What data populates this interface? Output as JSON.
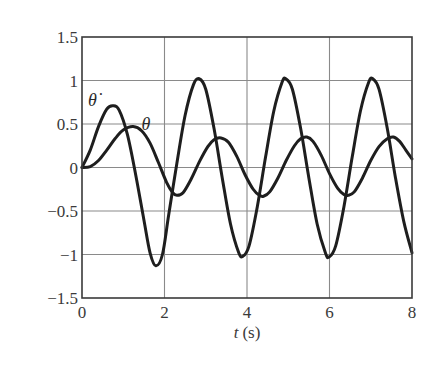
{
  "chart_data": {
    "type": "line",
    "title": "",
    "xlabel": "t (s)",
    "xlabel_italic_part": "t",
    "xlabel_unit": "(s)",
    "ylabel": "",
    "xlim": [
      0,
      8
    ],
    "ylim": [
      -1.5,
      1.5
    ],
    "xticks": [
      0,
      2,
      4,
      6,
      8
    ],
    "xtick_labels": [
      "0",
      "2",
      "4",
      "6",
      "8"
    ],
    "yticks": [
      1.5,
      1,
      0.5,
      0,
      -0.5,
      -1,
      -1.5
    ],
    "ytick_labels": [
      "1.5",
      "1",
      "0.5",
      "0",
      "−0.5",
      "−1",
      "−1.5"
    ],
    "grid": true,
    "legend": "none (inline curve labels)",
    "series": [
      {
        "name": "θ̇",
        "label_position": {
          "t": 0.25,
          "y": 0.78
        },
        "points": [
          [
            0,
            0
          ],
          [
            0.2,
            0.2
          ],
          [
            0.4,
            0.47
          ],
          [
            0.6,
            0.67
          ],
          [
            0.75,
            0.71
          ],
          [
            0.9,
            0.66
          ],
          [
            1.1,
            0.38
          ],
          [
            1.3,
            -0.08
          ],
          [
            1.5,
            -0.6
          ],
          [
            1.65,
            -0.98
          ],
          [
            1.79,
            -1.13
          ],
          [
            1.95,
            -1.0
          ],
          [
            2.1,
            -0.55
          ],
          [
            2.3,
            0.05
          ],
          [
            2.5,
            0.6
          ],
          [
            2.7,
            0.95
          ],
          [
            2.84,
            1.02
          ],
          [
            3.0,
            0.9
          ],
          [
            3.2,
            0.45
          ],
          [
            3.4,
            -0.12
          ],
          [
            3.6,
            -0.65
          ],
          [
            3.8,
            -0.98
          ],
          [
            3.9,
            -1.02
          ],
          [
            4.05,
            -0.9
          ],
          [
            4.25,
            -0.45
          ],
          [
            4.45,
            0.12
          ],
          [
            4.65,
            0.65
          ],
          [
            4.85,
            0.98
          ],
          [
            4.94,
            1.02
          ],
          [
            5.1,
            0.9
          ],
          [
            5.3,
            0.45
          ],
          [
            5.5,
            -0.12
          ],
          [
            5.7,
            -0.65
          ],
          [
            5.9,
            -0.98
          ],
          [
            5.99,
            -1.03
          ],
          [
            6.15,
            -0.9
          ],
          [
            6.35,
            -0.45
          ],
          [
            6.55,
            0.12
          ],
          [
            6.75,
            0.65
          ],
          [
            6.95,
            0.98
          ],
          [
            7.05,
            1.02
          ],
          [
            7.2,
            0.9
          ],
          [
            7.4,
            0.45
          ],
          [
            7.6,
            -0.12
          ],
          [
            7.8,
            -0.62
          ],
          [
            8.0,
            -0.98
          ]
        ]
      },
      {
        "name": "θ",
        "label_position": {
          "t": 1.55,
          "y": 0.5
        },
        "points": [
          [
            0,
            0
          ],
          [
            0.2,
            0.01
          ],
          [
            0.4,
            0.08
          ],
          [
            0.6,
            0.2
          ],
          [
            0.8,
            0.33
          ],
          [
            1.0,
            0.43
          ],
          [
            1.24,
            0.47
          ],
          [
            1.45,
            0.42
          ],
          [
            1.65,
            0.28
          ],
          [
            1.85,
            0.06
          ],
          [
            2.05,
            -0.17
          ],
          [
            2.2,
            -0.29
          ],
          [
            2.3,
            -0.32
          ],
          [
            2.45,
            -0.29
          ],
          [
            2.65,
            -0.13
          ],
          [
            2.85,
            0.07
          ],
          [
            3.05,
            0.24
          ],
          [
            3.2,
            0.32
          ],
          [
            3.37,
            0.34
          ],
          [
            3.55,
            0.29
          ],
          [
            3.75,
            0.13
          ],
          [
            3.95,
            -0.08
          ],
          [
            4.15,
            -0.25
          ],
          [
            4.3,
            -0.32
          ],
          [
            4.4,
            -0.33
          ],
          [
            4.55,
            -0.28
          ],
          [
            4.75,
            -0.12
          ],
          [
            4.95,
            0.08
          ],
          [
            5.15,
            0.25
          ],
          [
            5.3,
            0.33
          ],
          [
            5.45,
            0.35
          ],
          [
            5.6,
            0.3
          ],
          [
            5.8,
            0.14
          ],
          [
            6.0,
            -0.07
          ],
          [
            6.2,
            -0.24
          ],
          [
            6.35,
            -0.31
          ],
          [
            6.45,
            -0.32
          ],
          [
            6.6,
            -0.28
          ],
          [
            6.8,
            -0.12
          ],
          [
            7.0,
            0.08
          ],
          [
            7.2,
            0.24
          ],
          [
            7.4,
            0.33
          ],
          [
            7.55,
            0.35
          ],
          [
            7.7,
            0.3
          ],
          [
            7.85,
            0.2
          ],
          [
            8.0,
            0.1
          ]
        ]
      }
    ]
  },
  "colors": {
    "curve": "#1e1e1e",
    "grid": "#8a8a8a",
    "axis": "#3a3a3a",
    "text": "#3a3a3a"
  }
}
